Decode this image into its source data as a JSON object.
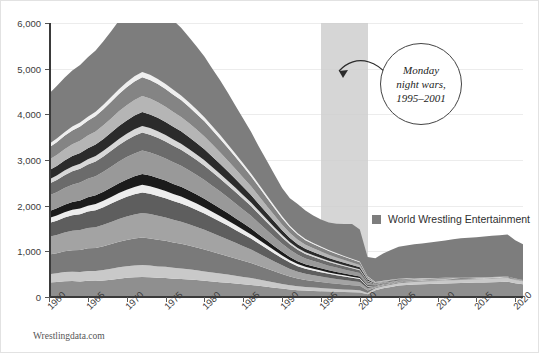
{
  "source_note": "Wrestlingdata.com",
  "legend": {
    "swatch_color": "#7d7d7d",
    "label": "World Wrestling Entertainment"
  },
  "annotation": {
    "line1": "Monday",
    "line2": "night wars,",
    "line3": "1995–2001"
  },
  "chart_data": {
    "type": "area",
    "title": "",
    "xlabel": "",
    "ylabel": "",
    "xlim": [
      1960,
      2021
    ],
    "ylim": [
      0,
      6000
    ],
    "grid": true,
    "legend_position": "inside-right",
    "ytick_labels": [
      "0",
      "1,000",
      "2,000",
      "3,000",
      "4,000",
      "5,000",
      "6,000"
    ],
    "ytick_values": [
      0,
      1000,
      2000,
      3000,
      4000,
      5000,
      6000
    ],
    "xtick_labels": [
      "1960",
      "1965",
      "1970",
      "1975",
      "1980",
      "1985",
      "1990",
      "1995",
      "2000",
      "2005",
      "2010",
      "2015",
      "2020"
    ],
    "xtick_values": [
      1960,
      1965,
      1970,
      1975,
      1980,
      1985,
      1990,
      1995,
      2000,
      2005,
      2010,
      2015,
      2020
    ],
    "highlight_band": {
      "label": "Monday night wars",
      "x0": 1995,
      "x1": 2001,
      "color": "#cfcfcf"
    },
    "x": [
      1960,
      1961,
      1962,
      1963,
      1964,
      1965,
      1966,
      1967,
      1968,
      1969,
      1970,
      1971,
      1972,
      1973,
      1974,
      1975,
      1976,
      1977,
      1978,
      1979,
      1980,
      1981,
      1982,
      1983,
      1984,
      1985,
      1986,
      1987,
      1988,
      1989,
      1990,
      1991,
      1992,
      1993,
      1994,
      1995,
      1996,
      1997,
      1998,
      1999,
      2000,
      2001,
      2002,
      2003,
      2004,
      2005,
      2006,
      2007,
      2008,
      2009,
      2010,
      2011,
      2012,
      2013,
      2014,
      2015,
      2016,
      2017,
      2018,
      2019,
      2020,
      2021
    ],
    "series": [
      {
        "name": "Promotion A",
        "color": "#8f8f8f",
        "values": [
          320,
          330,
          345,
          350,
          340,
          355,
          350,
          360,
          380,
          400,
          420,
          430,
          440,
          430,
          420,
          415,
          400,
          395,
          385,
          370,
          355,
          340,
          325,
          310,
          295,
          280,
          265,
          245,
          225,
          205,
          185,
          165,
          150,
          140,
          132,
          125,
          118,
          112,
          108,
          104,
          100,
          60,
          150,
          190,
          220,
          250,
          265,
          275,
          280,
          285,
          290,
          295,
          300,
          305,
          310,
          315,
          320,
          325,
          330,
          335,
          300,
          280
        ]
      },
      {
        "name": "Promotion B",
        "color": "#c9c9c9",
        "values": [
          180,
          190,
          200,
          205,
          210,
          215,
          220,
          230,
          240,
          250,
          255,
          260,
          262,
          258,
          250,
          245,
          238,
          230,
          222,
          214,
          205,
          196,
          188,
          180,
          170,
          160,
          150,
          138,
          126,
          114,
          102,
          92,
          84,
          78,
          74,
          70,
          66,
          62,
          58,
          54,
          50,
          30,
          40,
          45,
          48,
          52,
          54,
          56,
          58,
          60,
          62,
          64,
          66,
          68,
          70,
          72,
          74,
          76,
          78,
          80,
          72,
          66
        ]
      },
      {
        "name": "Promotion C",
        "color": "#7a7a7a",
        "values": [
          430,
          440,
          455,
          470,
          480,
          495,
          505,
          520,
          540,
          560,
          575,
          590,
          600,
          595,
          585,
          570,
          555,
          540,
          520,
          500,
          480,
          455,
          430,
          405,
          380,
          355,
          330,
          300,
          272,
          244,
          216,
          190,
          170,
          155,
          145,
          135,
          125,
          118,
          110,
          102,
          95,
          55,
          20,
          18,
          16,
          15,
          14,
          13,
          12,
          11,
          10,
          10,
          9,
          9,
          8,
          8,
          8,
          7,
          7,
          7,
          6,
          6
        ]
      },
      {
        "name": "Promotion D",
        "color": "#a3a3a3",
        "values": [
          390,
          400,
          415,
          425,
          435,
          445,
          455,
          470,
          485,
          500,
          515,
          528,
          538,
          532,
          522,
          510,
          496,
          482,
          465,
          448,
          430,
          410,
          388,
          366,
          342,
          318,
          294,
          268,
          242,
          216,
          190,
          168,
          150,
          136,
          126,
          118,
          110,
          102,
          96,
          90,
          84,
          48,
          18,
          16,
          14,
          13,
          12,
          11,
          10,
          9,
          9,
          8,
          8,
          7,
          7,
          6,
          6,
          6,
          5,
          5,
          5,
          4
        ]
      },
      {
        "name": "Promotion E",
        "color": "#5e5e5e",
        "values": [
          300,
          312,
          325,
          338,
          348,
          360,
          372,
          386,
          400,
          415,
          428,
          440,
          450,
          444,
          436,
          425,
          414,
          402,
          388,
          374,
          358,
          340,
          322,
          302,
          282,
          262,
          242,
          220,
          198,
          176,
          156,
          138,
          122,
          110,
          102,
          95,
          88,
          82,
          76,
          70,
          64,
          38,
          14,
          12,
          11,
          10,
          9,
          9,
          8,
          7,
          7,
          6,
          6,
          5,
          5,
          5,
          4,
          4,
          4,
          3,
          3,
          3
        ]
      },
      {
        "name": "Promotion F",
        "color": "#ededed",
        "values": [
          110,
          114,
          118,
          122,
          126,
          130,
          134,
          140,
          146,
          152,
          158,
          163,
          167,
          165,
          162,
          158,
          154,
          150,
          145,
          139,
          133,
          127,
          120,
          113,
          106,
          98,
          90,
          82,
          74,
          66,
          58,
          51,
          45,
          41,
          38,
          35,
          32,
          30,
          28,
          26,
          24,
          14,
          6,
          5,
          5,
          4,
          4,
          4,
          3,
          3,
          3,
          3,
          2,
          2,
          2,
          2,
          2,
          2,
          2,
          2,
          2,
          1
        ]
      },
      {
        "name": "Promotion G",
        "color": "#1b1b1b",
        "values": [
          150,
          156,
          163,
          170,
          176,
          183,
          190,
          198,
          207,
          216,
          224,
          232,
          238,
          235,
          231,
          226,
          220,
          214,
          207,
          199,
          191,
          181,
          172,
          161,
          151,
          140,
          129,
          117,
          105,
          93,
          82,
          72,
          64,
          58,
          54,
          50,
          46,
          43,
          40,
          37,
          34,
          20,
          8,
          7,
          6,
          6,
          5,
          5,
          4,
          4,
          4,
          3,
          3,
          3,
          3,
          2,
          2,
          2,
          2,
          2,
          2,
          2
        ]
      },
      {
        "name": "Promotion H",
        "color": "#999999",
        "values": [
          340,
          352,
          366,
          380,
          392,
          406,
          420,
          437,
          454,
          472,
          488,
          502,
          512,
          506,
          497,
          485,
          472,
          459,
          443,
          426,
          409,
          388,
          368,
          345,
          323,
          300,
          277,
          252,
          227,
          202,
          178,
          157,
          140,
          127,
          118,
          110,
          102,
          95,
          88,
          82,
          76,
          44,
          16,
          14,
          13,
          12,
          11,
          10,
          9,
          9,
          8,
          7,
          7,
          6,
          6,
          5,
          5,
          5,
          4,
          4,
          4,
          3
        ]
      },
      {
        "name": "Promotion I",
        "color": "#6b6b6b",
        "values": [
          260,
          270,
          281,
          292,
          301,
          312,
          323,
          336,
          349,
          363,
          375,
          386,
          394,
          389,
          382,
          373,
          363,
          353,
          341,
          328,
          315,
          299,
          283,
          266,
          249,
          231,
          213,
          194,
          175,
          156,
          137,
          121,
          108,
          98,
          91,
          85,
          79,
          73,
          68,
          63,
          58,
          34,
          12,
          11,
          10,
          9,
          9,
          8,
          7,
          7,
          6,
          6,
          5,
          5,
          4,
          4,
          4,
          3,
          3,
          3,
          3,
          2
        ]
      },
      {
        "name": "Promotion J",
        "color": "#d8d8d8",
        "values": [
          95,
          99,
          103,
          107,
          111,
          115,
          119,
          124,
          129,
          134,
          139,
          143,
          146,
          144,
          142,
          138,
          135,
          131,
          126,
          122,
          117,
          111,
          105,
          99,
          92,
          86,
          79,
          72,
          65,
          58,
          51,
          45,
          40,
          36,
          34,
          31,
          29,
          27,
          25,
          23,
          21,
          12,
          5,
          4,
          4,
          3,
          3,
          3,
          3,
          2,
          2,
          2,
          2,
          2,
          1,
          1,
          1,
          1,
          1,
          1,
          1,
          1
        ]
      },
      {
        "name": "Promotion K",
        "color": "#2b2b2b",
        "values": [
          200,
          208,
          217,
          226,
          233,
          241,
          250,
          260,
          270,
          281,
          290,
          299,
          305,
          301,
          296,
          289,
          281,
          273,
          264,
          254,
          244,
          231,
          219,
          206,
          193,
          179,
          165,
          150,
          135,
          121,
          106,
          94,
          84,
          76,
          70,
          66,
          61,
          57,
          52,
          48,
          45,
          26,
          10,
          8,
          8,
          7,
          6,
          6,
          5,
          5,
          4,
          4,
          4,
          3,
          3,
          3,
          2,
          2,
          2,
          2,
          2,
          2
        ]
      },
      {
        "name": "Promotion L",
        "color": "#b5b5b5",
        "values": [
          230,
          239,
          249,
          259,
          267,
          277,
          287,
          299,
          310,
          323,
          334,
          343,
          350,
          346,
          340,
          332,
          323,
          314,
          303,
          292,
          280,
          266,
          252,
          237,
          221,
          205,
          189,
          172,
          155,
          138,
          122,
          108,
          96,
          87,
          81,
          75,
          70,
          65,
          60,
          56,
          52,
          30,
          11,
          10,
          9,
          8,
          7,
          7,
          6,
          6,
          5,
          5,
          4,
          4,
          4,
          3,
          3,
          3,
          2,
          2,
          2,
          2
        ]
      },
      {
        "name": "Promotion M",
        "color": "#848484",
        "values": [
          270,
          281,
          292,
          304,
          314,
          325,
          337,
          351,
          365,
          380,
          392,
          404,
          412,
          407,
          399,
          390,
          380,
          369,
          356,
          343,
          329,
          313,
          296,
          278,
          260,
          241,
          222,
          202,
          182,
          162,
          143,
          126,
          113,
          102,
          94,
          88,
          82,
          76,
          70,
          65,
          60,
          35,
          13,
          11,
          10,
          9,
          8,
          8,
          7,
          6,
          6,
          5,
          5,
          4,
          4,
          4,
          3,
          3,
          3,
          2,
          2,
          2
        ]
      },
      {
        "name": "Promotion N",
        "color": "#efefef",
        "values": [
          75,
          78,
          81,
          84,
          87,
          90,
          94,
          98,
          102,
          106,
          110,
          113,
          115,
          114,
          112,
          109,
          106,
          103,
          100,
          96,
          92,
          87,
          83,
          78,
          73,
          67,
          62,
          56,
          51,
          45,
          40,
          35,
          31,
          28,
          26,
          24,
          22,
          21,
          19,
          18,
          16,
          10,
          4,
          3,
          3,
          3,
          2,
          2,
          2,
          2,
          2,
          1,
          1,
          1,
          1,
          1,
          1,
          1,
          1,
          1,
          1,
          1
        ]
      },
      {
        "name": "World Wrestling Entertainment",
        "color": "#7d7d7d",
        "values": [
          1100,
          1150,
          1190,
          1230,
          1260,
          1300,
          1340,
          1390,
          1440,
          1500,
          1550,
          1600,
          1640,
          1620,
          1590,
          1560,
          1520,
          1480,
          1430,
          1380,
          1330,
          1260,
          1200,
          1130,
          1050,
          980,
          910,
          830,
          760,
          690,
          620,
          600,
          640,
          620,
          600,
          590,
          600,
          640,
          700,
          760,
          700,
          420,
          520,
          600,
          650,
          700,
          720,
          740,
          760,
          780,
          800,
          820,
          840,
          860,
          870,
          880,
          890,
          900,
          910,
          920,
          840,
          780
        ]
      }
    ]
  }
}
